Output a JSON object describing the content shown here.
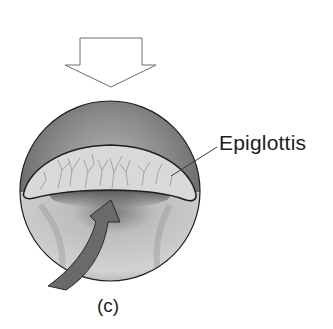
{
  "figure": {
    "panel_label": "(c)",
    "labels": [
      {
        "text": "Epiglottis",
        "target": "epiglottis"
      }
    ],
    "arrows": [
      {
        "name": "downward-hollow-arrow",
        "style": "outline",
        "direction": "down"
      },
      {
        "name": "curved-airflow-arrow",
        "style": "filled",
        "direction": "up"
      }
    ],
    "colors": {
      "background": "#ffffff",
      "outline": "#1e1e1e",
      "sphere_dark": "#6e6e6e",
      "sphere_light": "#d6d6d6",
      "epiglottis_fill": "#d9d9d9",
      "vessels": "#8c8c8c",
      "curved_arrow_fill": "#6a6a6a"
    }
  }
}
